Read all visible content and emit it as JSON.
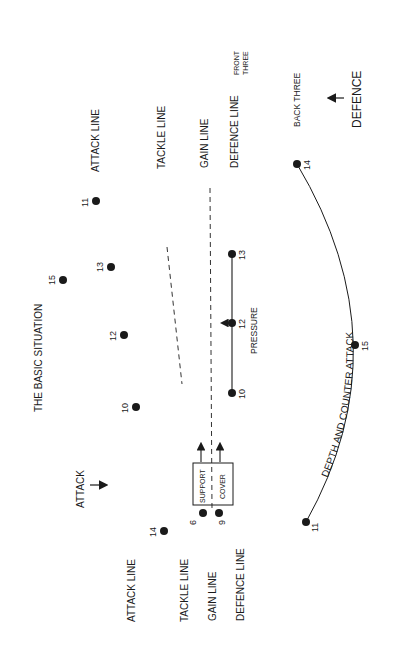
{
  "diagram": {
    "title": "THE BASIC SITUATION",
    "orientation": "rotated -90deg (reads bottom-to-top)",
    "colors": {
      "ink": "#1a1a1a",
      "background": "#ffffff"
    },
    "attack_side": {
      "direction_label": "ATTACK",
      "line_labels": {
        "attack_line": "ATTACK LINE",
        "tackle_line": "TACKLE LINE",
        "gain_line": "GAIN LINE",
        "defence_line": "DEFENCE LINE"
      },
      "players": [
        {
          "number": "11"
        },
        {
          "number": "15"
        },
        {
          "number": "13"
        },
        {
          "number": "12"
        },
        {
          "number": "10"
        },
        {
          "number": "14"
        },
        {
          "number": "6"
        },
        {
          "number": "9"
        }
      ],
      "box_labels": {
        "support": "SUPPORT",
        "cover": "COVER"
      }
    },
    "defence_side": {
      "direction_label": "DEFENCE",
      "line_labels": {
        "attack_line": "ATTACK LINE",
        "tackle_line": "TACKLE LINE",
        "gain_line": "GAIN LINE",
        "defence_line": "DEFENCE LINE",
        "front_three_1": "FRONT",
        "front_three_2": "THREE",
        "back_three": "BACK THREE"
      },
      "front_line_players": [
        {
          "number": "13"
        },
        {
          "number": "12"
        },
        {
          "number": "10"
        }
      ],
      "front_line_label": "PRESSURE",
      "back_players": [
        {
          "number": "14"
        },
        {
          "number": "15"
        },
        {
          "number": "11"
        }
      ],
      "curve_label": "DEPTH AND COUNTER ATTACK"
    }
  }
}
